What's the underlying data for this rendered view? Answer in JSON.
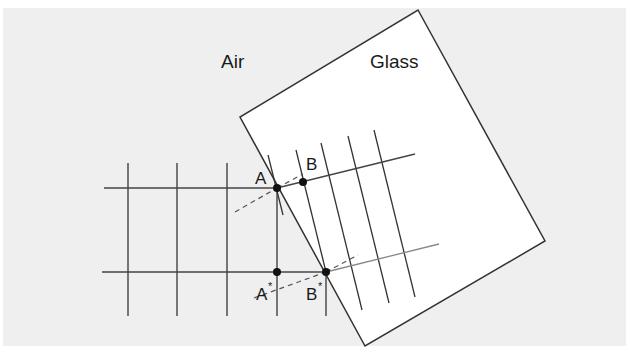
{
  "colors": {
    "background": "#ffffff",
    "panel": "#efefef",
    "glass": "#ffffff",
    "line": "#333333",
    "ray_glass": "#555555",
    "point": "#111111",
    "text": "#1a1a1a"
  },
  "labels": {
    "air": "Air",
    "glass": "Glass",
    "point_a": "A",
    "point_b": "B",
    "point_a_star": "A",
    "point_b_star": "B",
    "star": "*"
  }
}
